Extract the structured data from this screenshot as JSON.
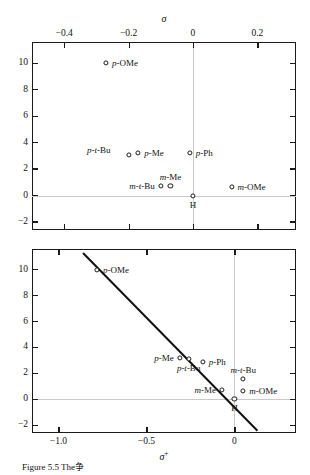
{
  "figure": {
    "caption": "Figure 5.5  The争"
  },
  "chart_data": [
    {
      "type": "scatter",
      "id": "sigma-panel",
      "title": "",
      "xlabel": "σ",
      "ylabel": "",
      "xlim": [
        -0.5,
        0.32
      ],
      "ylim": [
        -2.6,
        11.6
      ],
      "xticks": [
        -0.4,
        -0.2,
        0,
        0.2
      ],
      "xticklabels": [
        "−0.4",
        "−0.2",
        "0",
        "0.2"
      ],
      "yticks": [
        10,
        8,
        6,
        4,
        2,
        0,
        -2
      ],
      "yticklabels": [
        "10",
        "8",
        "6",
        "4",
        "2",
        "0",
        "−2"
      ],
      "xaxis_position": "top",
      "grid": "zero-lines-only",
      "legend": "none",
      "regression_line": null,
      "points": [
        {
          "label": "p-OMe",
          "prefix": "p",
          "name": "-OMe",
          "x": -0.27,
          "y": 10.0,
          "label_side": "right"
        },
        {
          "label": "p-t-Bu",
          "prefix": "p-t",
          "name": "-Bu",
          "x": -0.2,
          "y": 3.1,
          "label_side": "farleft"
        },
        {
          "label": "p-Me",
          "prefix": "p",
          "name": "-Me",
          "x": -0.17,
          "y": 3.2,
          "label_side": "right"
        },
        {
          "label": "p-Ph",
          "prefix": "p",
          "name": "-Ph",
          "x": -0.01,
          "y": 3.2,
          "label_side": "right"
        },
        {
          "label": "m-t-Bu",
          "prefix": "m-t",
          "name": "-Bu",
          "x": -0.1,
          "y": 0.7,
          "label_side": "left"
        },
        {
          "label": "m-Me",
          "prefix": "m",
          "name": "-Me",
          "x": -0.07,
          "y": 0.7,
          "label_side": "above"
        },
        {
          "label": "m-OMe",
          "prefix": "m",
          "name": "-OMe",
          "x": 0.12,
          "y": 0.65,
          "label_side": "right"
        },
        {
          "label": "H",
          "prefix": "",
          "name": "H",
          "x": 0.0,
          "y": 0.0,
          "label_side": "below"
        }
      ]
    },
    {
      "type": "scatter",
      "id": "sigma-plus-panel",
      "title": "",
      "xlabel": "σ⁺",
      "ylabel": "",
      "xlim": [
        -1.15,
        0.35
      ],
      "ylim": [
        -2.6,
        11.6
      ],
      "xticks": [
        -1.0,
        -0.5,
        0
      ],
      "xticklabels": [
        "−1.0",
        "−0.5",
        "0"
      ],
      "yticks": [
        10,
        8,
        6,
        4,
        2,
        0,
        -2
      ],
      "yticklabels": [
        "10",
        "8",
        "6",
        "4",
        "2",
        "0",
        "−2"
      ],
      "xaxis_position": "bottom",
      "grid": "zero-lines-only",
      "legend": "none",
      "regression_line": {
        "x1": -0.86,
        "y1": 11.4,
        "x2": 0.13,
        "y2": -2.3
      },
      "points": [
        {
          "label": "p-OMe",
          "prefix": "p",
          "name": "-OMe",
          "x": -0.78,
          "y": 10.0,
          "label_side": "right"
        },
        {
          "label": "p-Me",
          "prefix": "p",
          "name": "-Me",
          "x": -0.31,
          "y": 3.2,
          "label_side": "left"
        },
        {
          "label": "p-t-Bu",
          "prefix": "p-t",
          "name": "-Bu",
          "x": -0.26,
          "y": 3.1,
          "label_side": "below"
        },
        {
          "label": "p-Ph",
          "prefix": "p",
          "name": "-Ph",
          "x": -0.18,
          "y": 2.9,
          "label_side": "right"
        },
        {
          "label": "m-Me",
          "prefix": "m",
          "name": "-Me",
          "x": -0.07,
          "y": 0.7,
          "label_side": "left"
        },
        {
          "label": "m-t-Bu",
          "prefix": "m-t",
          "name": "-Bu",
          "x": 0.05,
          "y": 1.6,
          "label_side": "above"
        },
        {
          "label": "m-OMe",
          "prefix": "m",
          "name": "-OMe",
          "x": 0.05,
          "y": 0.65,
          "label_side": "right"
        },
        {
          "label": "H",
          "prefix": "",
          "name": "H",
          "x": 0.0,
          "y": 0.0,
          "label_side": "below"
        }
      ]
    }
  ]
}
